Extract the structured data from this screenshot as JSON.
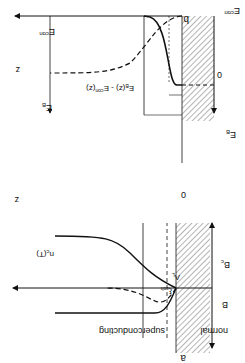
{
  "figure": {
    "orientation": "rotated-180",
    "panel_a": {
      "label": "a",
      "axis_z": "z",
      "origin": "0",
      "axis_B": "B",
      "Bc": "B",
      "Bc_sub": "c",
      "nc": "n",
      "nc_sub": "c",
      "nc_arg": "(T)",
      "lambda": "Λ",
      "lambda_sub": "L",
      "xi": "ξ",
      "xi_sub": "coh",
      "region_normal": "normal",
      "region_super": "superconducting"
    },
    "panel_b": {
      "label": "b",
      "axis_z": "z",
      "origin": "0",
      "Econ_axis": "E",
      "Econ_axis_sup": "con",
      "EB_axis": "E",
      "EB_axis_sub": "B",
      "Econ_curve": "E",
      "Econ_curve_sup": "con",
      "EB_curve": "E",
      "EB_curve_sub": "B",
      "diff_label": "E",
      "diff_label_sub": "B",
      "diff_label_mid": "(z) - E",
      "diff_label_sup": "con",
      "diff_label_end": "(z)"
    }
  }
}
